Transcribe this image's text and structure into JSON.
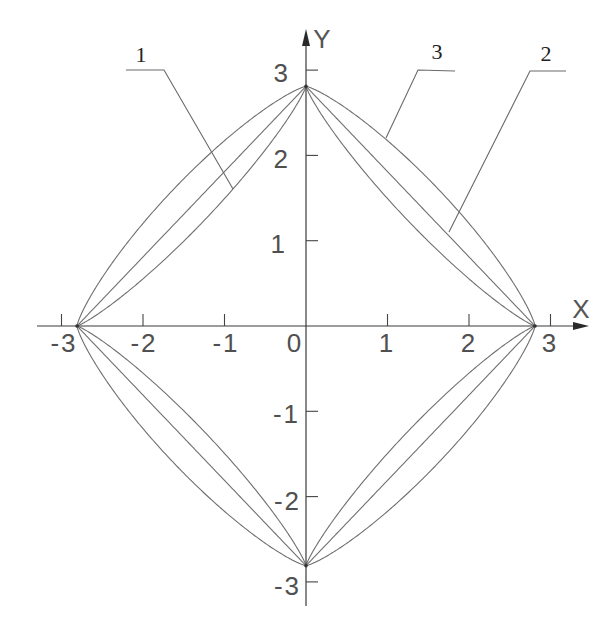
{
  "figure": {
    "x_axis_title": "X",
    "y_axis_title": "Y"
  },
  "callouts": [
    {
      "label": "1",
      "points_to": "inner curve (series 1)"
    },
    {
      "label": "3",
      "points_to": "outer curve (series 3)"
    },
    {
      "label": "2",
      "points_to": "middle curve (series 2)"
    }
  ],
  "chart_data": {
    "type": "line",
    "title": "",
    "xlabel": "X",
    "ylabel": "Y",
    "xlim": [
      -3.3,
      3.5
    ],
    "ylim": [
      -3.3,
      3.5
    ],
    "grid": false,
    "legend": "leader-line callouts labelled 1, 2, 3 at top of figure",
    "x_ticks": [
      -3,
      -2,
      -1,
      0,
      1,
      2,
      3
    ],
    "x_tick_labels": [
      "-3",
      "-2",
      "-1",
      "0",
      "1",
      "2",
      "3"
    ],
    "y_ticks": [
      3,
      2,
      1,
      -1,
      -2,
      -3
    ],
    "y_tick_labels": [
      "3",
      "2",
      "1",
      "-1",
      "-2",
      "-3"
    ],
    "symmetry": "each closed curve is symmetric about both X and Y axes",
    "common_points": [
      [
        2.81,
        0
      ],
      [
        0,
        2.81
      ],
      [
        -2.81,
        0
      ],
      [
        0,
        -2.81
      ]
    ],
    "series": [
      {
        "name": "1",
        "description": "inner closed curve, sides bow inward toward origin",
        "model": "superellipse |x|^p + |y|^p = a^p",
        "exponent": 0.85,
        "semi_axis": 2.81,
        "first_quadrant_points": {
          "x": [
            0,
            0.5,
            1.0,
            1.5,
            2.0,
            2.5,
            2.81
          ],
          "y": [
            2.81,
            2.06,
            1.49,
            1.0,
            0.55,
            0.18,
            0
          ]
        }
      },
      {
        "name": "2",
        "description": "middle closed curve, nearly straight sides (diamond)",
        "model": "superellipse |x|^p + |y|^p = a^p",
        "exponent": 1.0,
        "semi_axis": 2.81,
        "first_quadrant_points": {
          "x": [
            0,
            0.5,
            1.0,
            1.5,
            2.0,
            2.5,
            2.81
          ],
          "y": [
            2.81,
            2.31,
            1.81,
            1.31,
            0.81,
            0.31,
            0
          ]
        }
      },
      {
        "name": "3",
        "description": "outer closed curve, sides bulge outward",
        "model": "superellipse |x|^p + |y|^p = a^p",
        "exponent": 1.25,
        "semi_axis": 2.81,
        "first_quadrant_points": {
          "x": [
            0,
            0.5,
            1.0,
            1.5,
            2.0,
            2.5,
            2.81
          ],
          "y": [
            2.81,
            2.55,
            2.17,
            1.73,
            1.2,
            0.57,
            0
          ]
        }
      }
    ]
  }
}
